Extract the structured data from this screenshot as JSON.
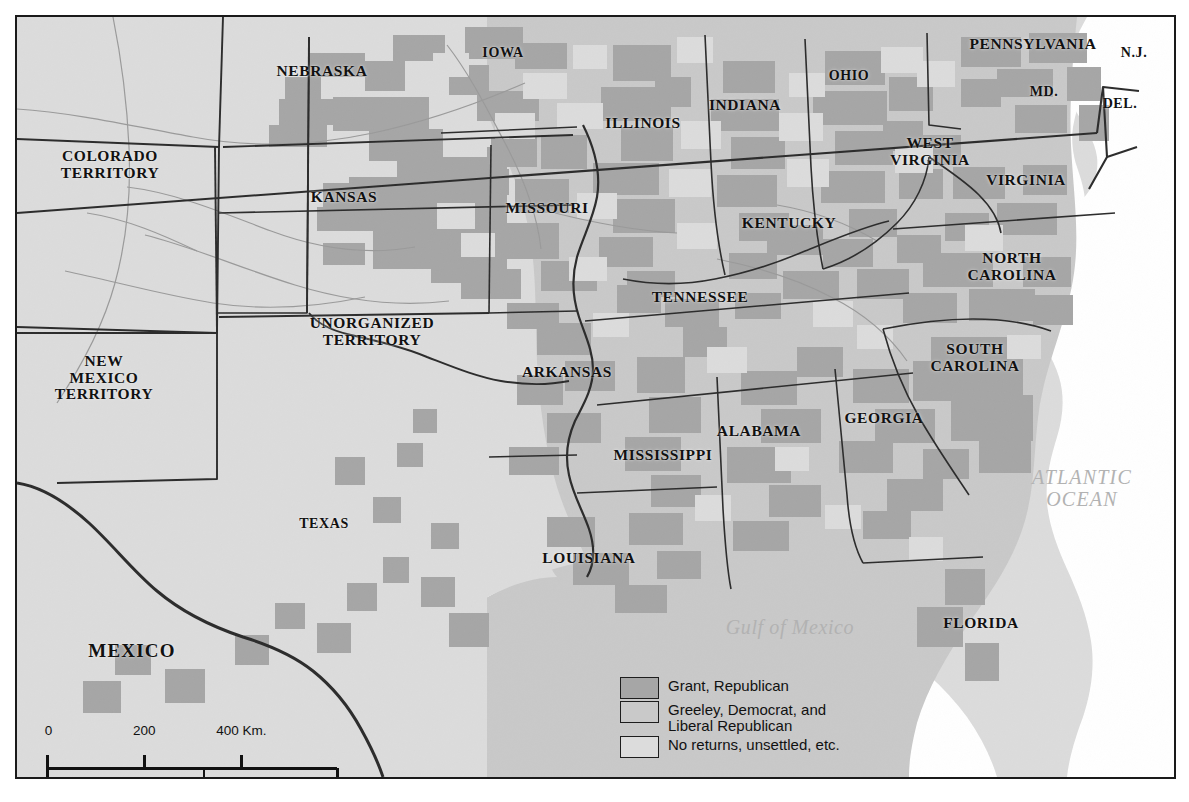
{
  "map": {
    "title": "Presidential Election of 1872 — county results",
    "ocean_labels": {
      "atlantic": "ATLANTIC\nOCEAN",
      "gulf": "Gulf of Mexico"
    },
    "country_labels": [
      {
        "name": "mexico",
        "text": "MEXICO",
        "x": 132,
        "y": 651
      }
    ],
    "state_labels": [
      {
        "name": "colorado-territory",
        "text": "COLORADO\nTERRITORY",
        "x": 110,
        "y": 165
      },
      {
        "name": "nebraska",
        "text": "NEBRASKA",
        "x": 322,
        "y": 71
      },
      {
        "name": "kansas",
        "text": "KANSAS",
        "x": 344,
        "y": 197
      },
      {
        "name": "iowa",
        "text": "IOWA",
        "x": 503,
        "y": 53
      },
      {
        "name": "missouri",
        "text": "MISSOURI",
        "x": 547,
        "y": 208
      },
      {
        "name": "illinois",
        "text": "ILLINOIS",
        "x": 643,
        "y": 123
      },
      {
        "name": "indiana",
        "text": "INDIANA",
        "x": 745,
        "y": 105
      },
      {
        "name": "ohio",
        "text": "OHIO",
        "x": 849,
        "y": 76
      },
      {
        "name": "pennsylvania",
        "text": "PENNSYLVANIA",
        "x": 1033,
        "y": 44
      },
      {
        "name": "new-jersey",
        "text": "N.J.",
        "x": 1134,
        "y": 53
      },
      {
        "name": "maryland",
        "text": "MD.",
        "x": 1044,
        "y": 92
      },
      {
        "name": "delaware",
        "text": "DEL.",
        "x": 1120,
        "y": 104
      },
      {
        "name": "west-virginia",
        "text": "WEST\nVIRGINIA",
        "x": 930,
        "y": 152
      },
      {
        "name": "virginia",
        "text": "VIRGINIA",
        "x": 1026,
        "y": 180
      },
      {
        "name": "kentucky",
        "text": "KENTUCKY",
        "x": 789,
        "y": 223
      },
      {
        "name": "north-carolina",
        "text": "NORTH\nCAROLINA",
        "x": 1012,
        "y": 267
      },
      {
        "name": "tennessee",
        "text": "TENNESSEE",
        "x": 700,
        "y": 297
      },
      {
        "name": "south-carolina",
        "text": "SOUTH\nCAROLINA",
        "x": 975,
        "y": 358
      },
      {
        "name": "arkansas",
        "text": "ARKANSAS",
        "x": 567,
        "y": 372
      },
      {
        "name": "georgia",
        "text": "GEORGIA",
        "x": 884,
        "y": 418
      },
      {
        "name": "alabama",
        "text": "ALABAMA",
        "x": 759,
        "y": 431
      },
      {
        "name": "mississippi",
        "text": "MISSISSIPPI",
        "x": 663,
        "y": 455
      },
      {
        "name": "louisiana",
        "text": "LOUISIANA",
        "x": 589,
        "y": 558
      },
      {
        "name": "florida",
        "text": "FLORIDA",
        "x": 981,
        "y": 623
      },
      {
        "name": "texas",
        "text": "TEXAS",
        "x": 324,
        "y": 524
      },
      {
        "name": "new-mexico-territory",
        "text": "NEW\nMEXICO\nTERRITORY",
        "x": 104,
        "y": 378
      },
      {
        "name": "unorganized-territory",
        "text": "UNORGANIZED\nTERRITORY",
        "x": 372,
        "y": 332
      }
    ]
  },
  "legend": {
    "items": [
      {
        "name": "grant-republican",
        "label": "Grant, Republican",
        "color": "#a6a6a6"
      },
      {
        "name": "greeley-democrat",
        "label": "Greeley, Democrat, and\nLiberal Republican",
        "color": "#c9c9c9"
      },
      {
        "name": "no-returns",
        "label": "No returns, unsettled, etc.",
        "color": "#dcdcdc"
      }
    ]
  },
  "scalebar": {
    "km": {
      "ticks": [
        "0",
        "200",
        "400 Km."
      ],
      "positions": [
        0,
        33.5,
        67
      ]
    },
    "mi": {
      "ticks": [
        "0",
        "200",
        "400 Mi."
      ],
      "positions": [
        0,
        54,
        100
      ]
    }
  },
  "colors": {
    "grant": "#a6a6a6",
    "greeley": "#c9c9c9",
    "no_returns": "#dcdcdc",
    "water": "#ffffff",
    "border": "#2b2b2b",
    "water_text": "#b2b2b2"
  }
}
